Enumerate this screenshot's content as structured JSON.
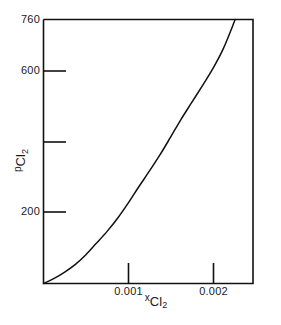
{
  "chart_data": {
    "type": "line",
    "title": "",
    "xlabel": "xCl2",
    "ylabel": "pCl2",
    "xlabel_parts": {
      "prefix": "x",
      "main": "Cl",
      "sub": "2"
    },
    "ylabel_parts": {
      "prefix": "p",
      "main": "Cl",
      "sub": "2"
    },
    "xlim": [
      0,
      0.00247
    ],
    "ylim": [
      0,
      760
    ],
    "grid": false,
    "legend": null,
    "xticks": [
      0.001,
      0.002
    ],
    "xtick_labels": [
      "0.001",
      "0.002"
    ],
    "yticks": [
      200,
      400,
      600,
      760
    ],
    "ytick_labels": [
      "200",
      "",
      "600",
      "760"
    ],
    "series": [
      {
        "name": "pCl2 vs xCl2",
        "color": "#111111",
        "x": [
          0.0,
          0.00012,
          0.00025,
          0.00038,
          0.0005,
          0.00062,
          0.00075,
          0.00088,
          0.001,
          0.00112,
          0.00125,
          0.00138,
          0.0015,
          0.00162,
          0.00175,
          0.00188,
          0.002,
          0.00212,
          0.00226
        ],
        "y": [
          0,
          14,
          33,
          56,
          83,
          115,
          150,
          190,
          232,
          277,
          324,
          373,
          422,
          472,
          522,
          572,
          620,
          676,
          760
        ]
      }
    ]
  },
  "axes": {
    "frame_color": "#111111",
    "background": "#ffffff"
  }
}
